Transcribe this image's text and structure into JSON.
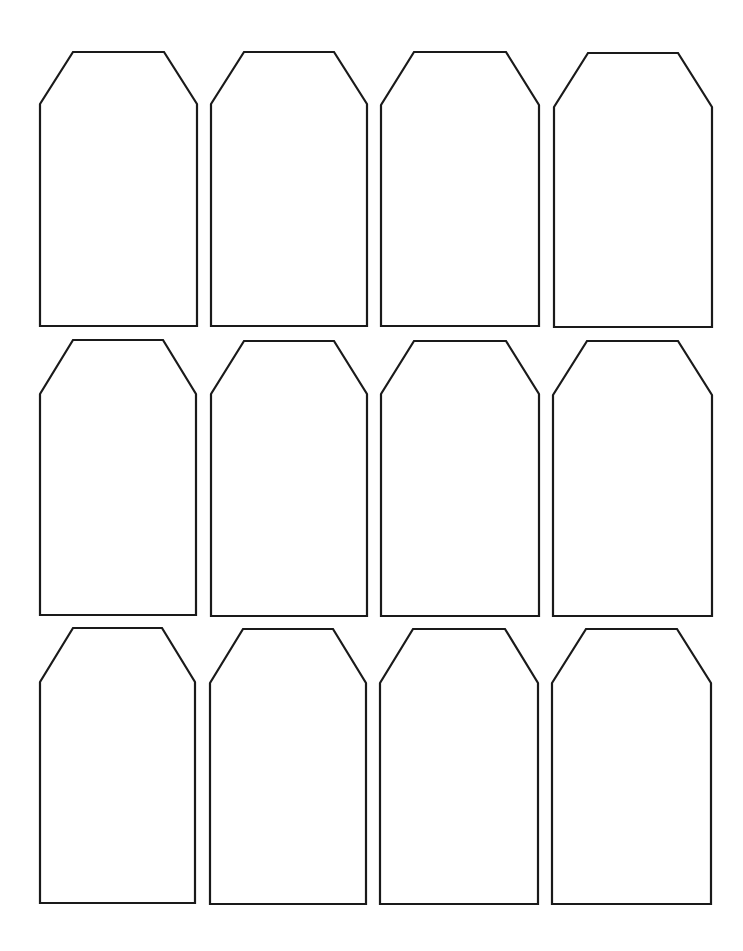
{
  "page": {
    "background": "#ffffff",
    "stroke": "#1a1a1a"
  },
  "tags": [
    {
      "x": 40,
      "y": 52,
      "w": 157,
      "h": 274,
      "cut": 33,
      "shoulder": 52
    },
    {
      "x": 211,
      "y": 52,
      "w": 156,
      "h": 274,
      "cut": 33,
      "shoulder": 52
    },
    {
      "x": 381,
      "y": 52,
      "w": 158,
      "h": 274,
      "cut": 33,
      "shoulder": 53
    },
    {
      "x": 554,
      "y": 53,
      "w": 158,
      "h": 274,
      "cut": 34,
      "shoulder": 54
    },
    {
      "x": 40,
      "y": 340,
      "w": 156,
      "h": 275,
      "cut": 33,
      "shoulder": 54
    },
    {
      "x": 211,
      "y": 341,
      "w": 156,
      "h": 275,
      "cut": 33,
      "shoulder": 53
    },
    {
      "x": 381,
      "y": 341,
      "w": 158,
      "h": 275,
      "cut": 33,
      "shoulder": 53
    },
    {
      "x": 553,
      "y": 341,
      "w": 159,
      "h": 275,
      "cut": 34,
      "shoulder": 54
    },
    {
      "x": 40,
      "y": 628,
      "w": 155,
      "h": 275,
      "cut": 33,
      "shoulder": 54
    },
    {
      "x": 210,
      "y": 629,
      "w": 156,
      "h": 275,
      "cut": 33,
      "shoulder": 54
    },
    {
      "x": 380,
      "y": 629,
      "w": 158,
      "h": 275,
      "cut": 33,
      "shoulder": 54
    },
    {
      "x": 552,
      "y": 629,
      "w": 159,
      "h": 275,
      "cut": 34,
      "shoulder": 54
    }
  ]
}
